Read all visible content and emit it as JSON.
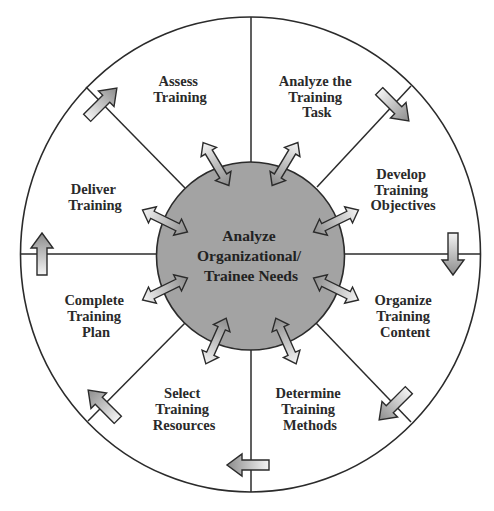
{
  "colors": {
    "background": "#ffffff",
    "outline": "#2b2b2b",
    "hub_fill": "#a3a3a3",
    "arrow_light": "#f2f2f2",
    "arrow_dark": "#8f8f8f",
    "text": "#2a2a2a"
  },
  "hub": {
    "lines": [
      "Analyze",
      "Organizational/",
      "Trainee Needs"
    ]
  },
  "segments": [
    {
      "id": "assess-training",
      "lines": [
        "Assess",
        "Training"
      ]
    },
    {
      "id": "analyze-training-task",
      "lines": [
        "Analyze the",
        "Training",
        "Task"
      ]
    },
    {
      "id": "develop-training-objectives",
      "lines": [
        "Develop",
        "Training",
        "Objectives"
      ]
    },
    {
      "id": "organize-training-content",
      "lines": [
        "Organize",
        "Training",
        "Content"
      ]
    },
    {
      "id": "determine-training-methods",
      "lines": [
        "Determine",
        "Training",
        "Methods"
      ]
    },
    {
      "id": "select-training-resources",
      "lines": [
        "Select",
        "Training",
        "Resources"
      ]
    },
    {
      "id": "complete-training-plan",
      "lines": [
        "Complete",
        "Training",
        "Plan"
      ]
    },
    {
      "id": "deliver-training",
      "lines": [
        "Deliver",
        "Training"
      ]
    }
  ],
  "icons": {
    "rim_arrow": "single-arrow-icon",
    "hub_arrow": "double-arrow-icon"
  }
}
